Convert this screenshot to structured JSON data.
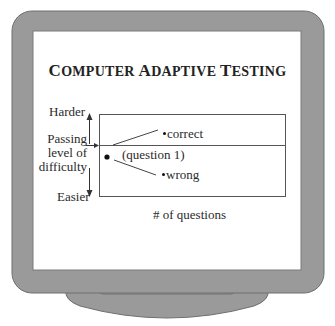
{
  "title": {
    "words": [
      {
        "cap": "C",
        "rest": "OMPUTER"
      },
      {
        "cap": "A",
        "rest": "DAPTIVE"
      },
      {
        "cap": "T",
        "rest": "ESTING"
      }
    ]
  },
  "axis": {
    "top_label": "Harder",
    "middle_label_lines": [
      "Passing",
      "level of",
      "difficulty"
    ],
    "bottom_label": "Easier",
    "x_label": "# of questions"
  },
  "points": {
    "start": "(question 1)",
    "up": "correct",
    "down": "wrong"
  },
  "colors": {
    "bezel": "#9a9a9a",
    "bezel_edge": "#6f6f6f",
    "screen": "#ffffff",
    "line": "#555555"
  }
}
